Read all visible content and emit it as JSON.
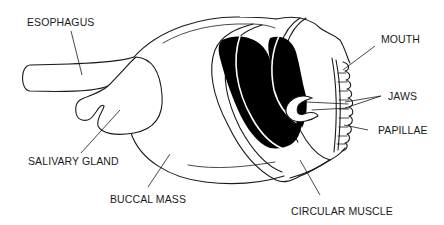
{
  "diagram": {
    "labels": {
      "esophagus": "ESOPHAGUS",
      "salivary_gland": "SALIVARY GLAND",
      "buccal_mass": "BUCCAL MASS",
      "mouth": "MOUTH",
      "jaws": "JAWS",
      "papillae": "PAPILLAE",
      "circular_muscle": "CIRCULAR MUSCLE"
    },
    "colors": {
      "line": "#1a1a1a",
      "fill_dark": "#000000",
      "background": "#ffffff"
    }
  }
}
